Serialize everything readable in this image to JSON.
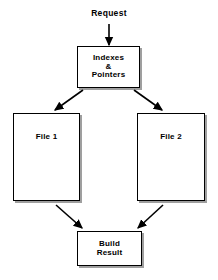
{
  "diagram": {
    "background_color": "#ffffff",
    "line_color": "#000000",
    "text_color": "#000000",
    "nodes": {
      "request": {
        "label": "Request",
        "shape": "text"
      },
      "indexes": {
        "label": "Indexes\n&\nPointers",
        "shape": "rectangle"
      },
      "file1": {
        "label": "File 1",
        "shape": "rectangle"
      },
      "file2": {
        "label": "File 2",
        "shape": "rectangle"
      },
      "build": {
        "label": "Build\nResult",
        "shape": "rectangle"
      }
    },
    "edges": [
      {
        "from": "request",
        "to": "indexes",
        "style": "arrow-down"
      },
      {
        "from": "indexes",
        "to": "file1",
        "style": "arrow-diagonal-down-left"
      },
      {
        "from": "indexes",
        "to": "file2",
        "style": "arrow-diagonal-down-right"
      },
      {
        "from": "file1",
        "to": "build",
        "style": "arrow-diagonal-down-right"
      },
      {
        "from": "file2",
        "to": "build",
        "style": "arrow-diagonal-down-left"
      }
    ]
  }
}
